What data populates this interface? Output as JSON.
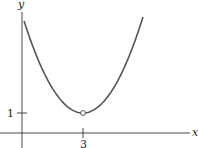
{
  "chart_data": {
    "type": "line",
    "title": "",
    "xlabel": "x",
    "ylabel": "y",
    "x_ticks": [
      {
        "value": 3,
        "label": "3"
      }
    ],
    "y_ticks": [
      {
        "value": 1,
        "label": "1"
      }
    ],
    "xlim": [
      -1,
      5.5
    ],
    "ylim": [
      -1,
      6.5
    ],
    "grid": false,
    "legend": null,
    "series": [
      {
        "name": "curve",
        "description": "parabola-shaped curve with minimum near (3, 1); open circle (hole) at the vertex",
        "x": [
          0.1,
          0.5,
          1,
          1.5,
          2,
          2.5,
          3,
          3.5,
          4,
          4.5,
          5,
          5.5,
          5.95
        ],
        "y": [
          5.6,
          4.4,
          3.2,
          2.24,
          1.55,
          1.14,
          1,
          1.14,
          1.55,
          2.24,
          3.2,
          4.4,
          5.8
        ]
      }
    ],
    "annotations": [
      {
        "type": "open-circle",
        "x": 3,
        "y": 1,
        "meaning": "point excluded from graph"
      }
    ],
    "colors": {
      "curve": "#555555",
      "axes": "#333333"
    }
  },
  "labels": {
    "x_axis": "x",
    "y_axis": "y",
    "tick_x": "3",
    "tick_y": "1"
  }
}
